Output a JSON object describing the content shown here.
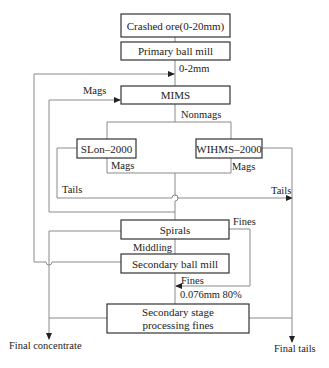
{
  "diagram": {
    "type": "process-flowsheet",
    "nodes": [
      {
        "id": "crushed-ore",
        "label": "Crashed ore(0-20mm)"
      },
      {
        "id": "primary-ball-mill",
        "label": "Primary ball mill"
      },
      {
        "id": "mims",
        "label": "MIMS"
      },
      {
        "id": "slon",
        "label": "SLon–2000"
      },
      {
        "id": "wihms",
        "label": "WIHMS–2000"
      },
      {
        "id": "spirals",
        "label": "Spirals"
      },
      {
        "id": "secondary-ball-mill",
        "label": "Secondary ball mill"
      },
      {
        "id": "secondary-stage",
        "label_line1": "Secondary stage",
        "label_line2": "processing fines"
      }
    ],
    "edge_labels": {
      "primary_out": "0-2mm",
      "mims_mags": "Mags",
      "mims_nonmags": "Nonmags",
      "slon_mags": "Mags",
      "wihms_mags": "Mags",
      "slon_tails": "Tails",
      "wihms_tails": "Tails",
      "spirals_fines": "Fines",
      "spirals_middling": "Middling",
      "mill_fines": "Fines",
      "mill_size": "0.076mm 80%"
    },
    "outputs": {
      "final_concentrate": "Final concentrate",
      "final_tails": "Final tails"
    }
  }
}
